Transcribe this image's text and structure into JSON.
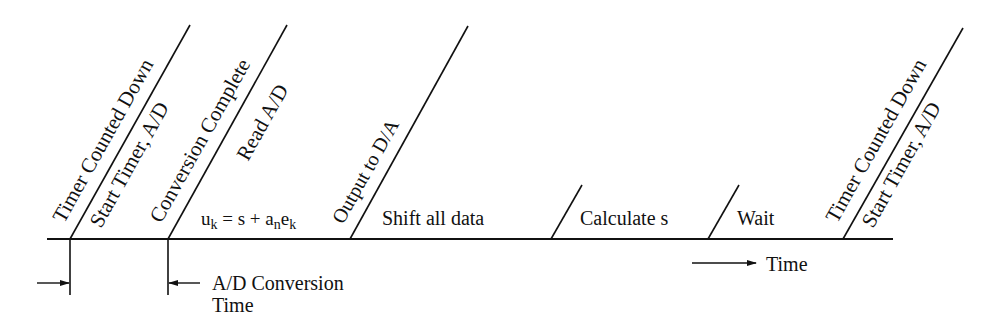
{
  "diagram": {
    "type": "timing-diagram",
    "events": [
      {
        "upper": "Timer Counted Down",
        "lower": "Start Timer, A/D"
      },
      {
        "upper": "Conversion Complete",
        "lower": "Read A/D"
      },
      {
        "upper": "Output to D/A"
      },
      {
        "upper": "Timer Counted Down",
        "lower": "Start Timer, A/D"
      }
    ],
    "segments": {
      "control_law_u": "u",
      "control_law_u_sub": "k",
      "control_law_rest": " = s + a",
      "control_law_a_sub": "n",
      "control_law_e": "e",
      "control_law_e_sub": "k",
      "shift": "Shift all data",
      "calculate": "Calculate s",
      "wait": "Wait"
    },
    "annotations": {
      "conversion_line1": "A/D Conversion",
      "conversion_line2": "Time",
      "time_axis": "Time"
    },
    "colors": {
      "ink": "#111111",
      "background": "#ffffff"
    }
  }
}
